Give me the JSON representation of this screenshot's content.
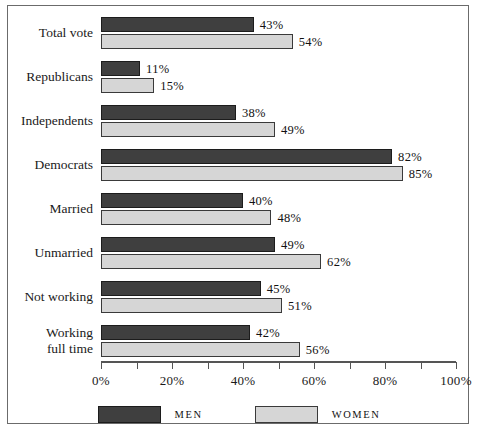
{
  "chart_data": {
    "type": "bar",
    "orientation": "horizontal",
    "title": "",
    "subtitle": "",
    "xlabel": "",
    "ylabel": "",
    "xlim": [
      0,
      100
    ],
    "grid": false,
    "legend_position": "bottom",
    "value_suffix": "%",
    "categories": [
      "Total vote",
      "Republicans",
      "Independents",
      "Democrats",
      "Married",
      "Unmarried",
      "Not working",
      "Working\nfull time"
    ],
    "series": [
      {
        "name": "MEN",
        "color": "#3f3f3f",
        "values": [
          43,
          11,
          38,
          82,
          40,
          49,
          45,
          42
        ],
        "labels": [
          "43%",
          "11%",
          "38%",
          "82%",
          "40%",
          "49%",
          "45%",
          "42%"
        ]
      },
      {
        "name": "WOMEN",
        "color": "#d6d6d6",
        "values": [
          54,
          15,
          49,
          85,
          48,
          62,
          51,
          56
        ],
        "labels": [
          "54%",
          "15%",
          "49%",
          "85%",
          "48%",
          "62%",
          "51%",
          "56%"
        ]
      }
    ],
    "axis": {
      "tick_values": [
        0,
        10,
        20,
        30,
        40,
        50,
        60,
        70,
        80,
        90,
        100
      ],
      "labeled_ticks": [
        0,
        20,
        40,
        60,
        80,
        100
      ],
      "tick_labels": [
        "0%",
        "20%",
        "40%",
        "60%",
        "80%",
        "100%"
      ]
    }
  },
  "legend": {
    "entries": [
      {
        "label": "MEN",
        "key": "men"
      },
      {
        "label": "WOMEN",
        "key": "women"
      }
    ]
  },
  "colors": {
    "men_bar": "#3f3f3f",
    "women_bar": "#d6d6d6",
    "frame_border": "#6b6b6b",
    "axis": "#555555",
    "text": "#111111"
  }
}
